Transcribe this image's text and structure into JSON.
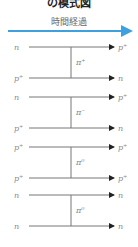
{
  "title": "の模式図",
  "time_axis": {
    "label": "時間経過",
    "color": "#3fa0e0"
  },
  "panels": [
    {
      "top_in": "n",
      "top_out": "p⁺",
      "bottom_in": "p⁺",
      "bottom_out": "n",
      "exchange": "π⁺"
    },
    {
      "top_in": "n",
      "top_out": "p⁺",
      "bottom_in": "p⁺",
      "bottom_out": "n",
      "exchange": "π⁻"
    },
    {
      "top_in": "p⁺",
      "top_out": "p⁺",
      "bottom_in": "p⁺",
      "bottom_out": "p⁺",
      "exchange": "π⁰"
    },
    {
      "top_in": "n",
      "top_out": "n",
      "bottom_in": "n",
      "bottom_out": "n",
      "exchange": "π⁰"
    }
  ],
  "colors": {
    "line": "#777777",
    "arrowhead": "#222222"
  }
}
